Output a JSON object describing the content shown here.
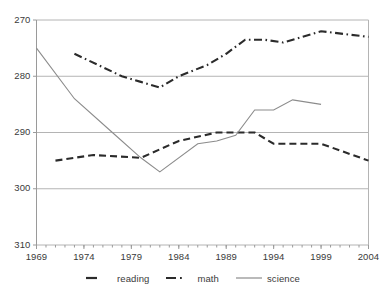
{
  "chart_data": {
    "type": "line",
    "title": "",
    "subtitle": "",
    "xlabel": "",
    "ylabel": "",
    "xlim": [
      1969,
      2004
    ],
    "ylim": [
      270,
      310
    ],
    "yticks": [
      270,
      280,
      290,
      300,
      310
    ],
    "xticks": [
      1969,
      1974,
      1979,
      1984,
      1989,
      1994,
      1999,
      2004
    ],
    "x_minor_tick_interval": 1,
    "grid": "horizontal",
    "legend_position": "bottom",
    "series": [
      {
        "name": "reading",
        "style": "dashed",
        "color": "#2b2b2b",
        "points": [
          {
            "x": 1971,
            "y": 285
          },
          {
            "x": 1975,
            "y": 286
          },
          {
            "x": 1980,
            "y": 285.5
          },
          {
            "x": 1984,
            "y": 288.5
          },
          {
            "x": 1988,
            "y": 290
          },
          {
            "x": 1990,
            "y": 290
          },
          {
            "x": 1992,
            "y": 290
          },
          {
            "x": 1994,
            "y": 288
          },
          {
            "x": 1996,
            "y": 288
          },
          {
            "x": 1999,
            "y": 288
          },
          {
            "x": 2004,
            "y": 285
          }
        ]
      },
      {
        "name": "math",
        "style": "dash-dot",
        "color": "#2b2b2b",
        "points": [
          {
            "x": 1973,
            "y": 304
          },
          {
            "x": 1978,
            "y": 300
          },
          {
            "x": 1980,
            "y": 299
          },
          {
            "x": 1982,
            "y": 298
          },
          {
            "x": 1984,
            "y": 300
          },
          {
            "x": 1987,
            "y": 302
          },
          {
            "x": 1989,
            "y": 304
          },
          {
            "x": 1991,
            "y": 306.5
          },
          {
            "x": 1993,
            "y": 306.5
          },
          {
            "x": 1995,
            "y": 306
          },
          {
            "x": 1997,
            "y": 307
          },
          {
            "x": 1999,
            "y": 308
          },
          {
            "x": 2004,
            "y": 307
          }
        ]
      },
      {
        "name": "science",
        "style": "solid",
        "color": "#8c8c8c",
        "points": [
          {
            "x": 1969,
            "y": 305
          },
          {
            "x": 1973,
            "y": 296
          },
          {
            "x": 1977,
            "y": 290
          },
          {
            "x": 1980,
            "y": 285.5
          },
          {
            "x": 1982,
            "y": 283
          },
          {
            "x": 1986,
            "y": 288
          },
          {
            "x": 1988,
            "y": 288.5
          },
          {
            "x": 1990,
            "y": 289.5
          },
          {
            "x": 1992,
            "y": 294
          },
          {
            "x": 1994,
            "y": 294
          },
          {
            "x": 1996,
            "y": 295.8
          },
          {
            "x": 1999,
            "y": 295
          }
        ]
      }
    ]
  },
  "axes": {
    "y_tick_labels": [
      "310",
      "300",
      "290",
      "280",
      "270"
    ],
    "x_tick_labels": [
      "1969",
      "1974",
      "1979",
      "1984",
      "1989",
      "1994",
      "1999",
      "2004"
    ]
  },
  "legend": {
    "items": [
      {
        "label": "reading",
        "swatch": "dashed-line-swatch"
      },
      {
        "label": "math",
        "swatch": "dash-dot-line-swatch"
      },
      {
        "label": "science",
        "swatch": "solid-line-swatch"
      }
    ]
  },
  "colors": {
    "series_dark": "#2b2b2b",
    "series_gray": "#8c8c8c",
    "grid": "#b4b4b4",
    "axis": "#9a9a9a",
    "text": "#3a3a3a",
    "background": "#ffffff"
  }
}
